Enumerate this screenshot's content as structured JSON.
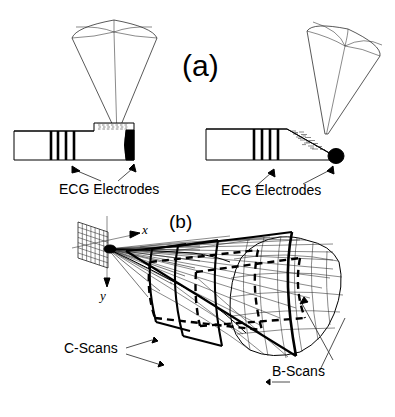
{
  "figure": {
    "background_color": "#ffffff",
    "ink_color": "#000000",
    "panels": [
      {
        "id": "a",
        "label": "(a)",
        "caption_role": "panel-label"
      },
      {
        "id": "b",
        "label": "(b)",
        "caption_role": "panel-label"
      }
    ]
  },
  "panel_a": {
    "label": "(a)",
    "left_probe": {
      "name": "side-firing-transducer",
      "tip_style": "flat-black-end",
      "electrode_band_count": 4,
      "annotation": "ECG Electrodes",
      "beam": {
        "shape": "sector-cone",
        "orientation": "vertical"
      }
    },
    "right_probe": {
      "name": "forward-tilted-transducer",
      "tip_style": "round-black-tip",
      "electrode_band_count": 4,
      "annotation": "ECG Electrodes",
      "beam": {
        "shape": "sector-cone",
        "orientation": "tilted"
      }
    },
    "labels": {
      "ecg_left": "ECG Electrodes",
      "ecg_right": "ECG Electrodes"
    }
  },
  "panel_b": {
    "label": "(b)",
    "axes": {
      "x_label": "x",
      "y_label": "y"
    },
    "array": {
      "name": "2d-phased-array",
      "grid_rows": 7,
      "grid_cols": 7
    },
    "volume": {
      "name": "pyramidal-scan-volume",
      "mesh_rows": 7,
      "mesh_cols": 9
    },
    "labels": {
      "c_scans": "C-Scans",
      "b_scans": "B-Scans"
    }
  }
}
